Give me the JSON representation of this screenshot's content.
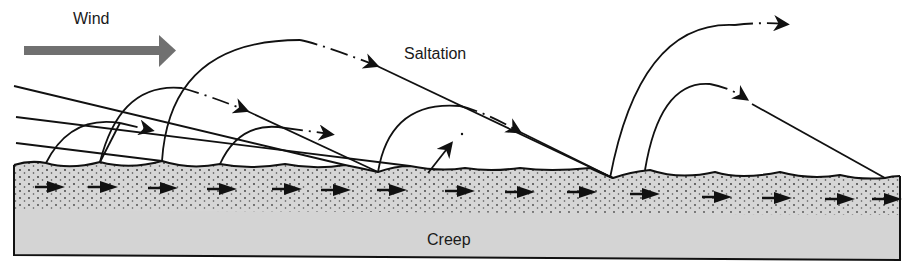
{
  "diagram": {
    "title_labels": {
      "wind": "Wind",
      "saltation": "Saltation",
      "creep": "Creep"
    },
    "colors": {
      "background": "#ffffff",
      "wind_arrow": "#707070",
      "ground_fill": "#d4d4d4",
      "ink": "#111111"
    },
    "wind_arrow": {
      "icon": "wind-direction-arrow-icon",
      "direction": "right"
    },
    "components": [
      {
        "name": "saltation",
        "description": "grains bouncing along curved trajectories above the surface"
      },
      {
        "name": "creep",
        "description": "grains rolling along the surface layer"
      }
    ],
    "creep_arrow_count": 15
  }
}
